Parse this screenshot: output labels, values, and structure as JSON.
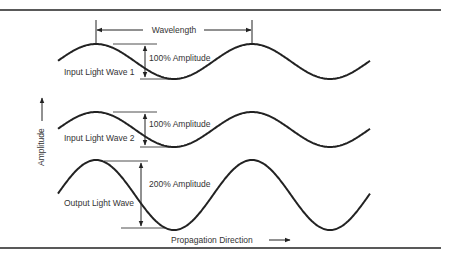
{
  "colors": {
    "ink": "#222222",
    "text": "#333333",
    "background": "#ffffff"
  },
  "wavelength_label": "Wavelength",
  "axis": {
    "y_label": "Amplitude",
    "x_label": "Propagation Direction"
  },
  "waves": [
    {
      "name": "Input Light Wave 1",
      "amplitude_label": "100% Amplitude",
      "relative_amplitude": 1
    },
    {
      "name": "Input Light Wave 2",
      "amplitude_label": "100% Amplitude",
      "relative_amplitude": 1
    },
    {
      "name": "Output Light Wave",
      "amplitude_label": "200% Amplitude",
      "relative_amplitude": 2
    }
  ],
  "cycles_shown": 2
}
